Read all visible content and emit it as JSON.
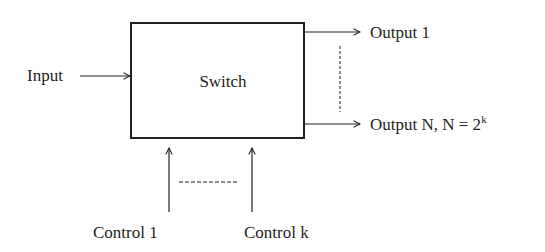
{
  "diagram": {
    "box": {
      "label": "Switch"
    },
    "input": {
      "label": "Input"
    },
    "outputs": [
      {
        "label": "Output 1"
      },
      {
        "label_main": "Output N, N = 2",
        "label_sup": "k"
      }
    ],
    "controls": [
      {
        "label": "Control 1"
      },
      {
        "label": "Control k"
      }
    ],
    "colors": {
      "stroke": "#231f20",
      "background": "#ffffff"
    }
  }
}
